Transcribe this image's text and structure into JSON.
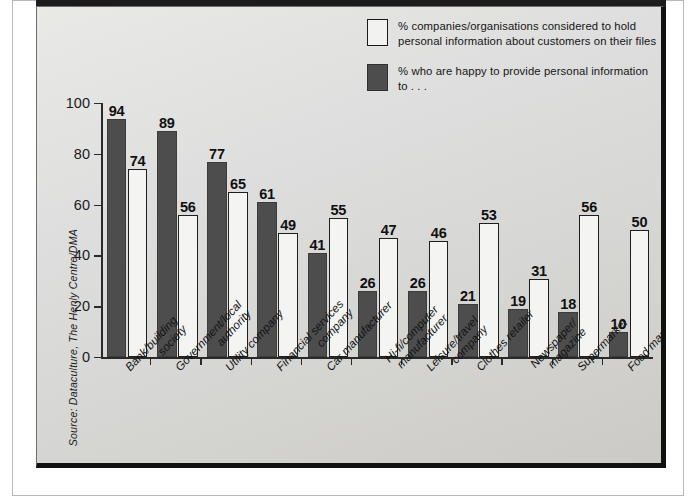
{
  "figure": {
    "source_note": "Source: Dataculture, The Henly Centre/DMA"
  },
  "legend": {
    "items": [
      {
        "swatch": "light",
        "line1": "% companies/organisations considered to hold",
        "line2": "personal information about customers on their files"
      },
      {
        "swatch": "dark",
        "line1": "% who are happy to provide personal information to . . .",
        "line2": ""
      }
    ]
  },
  "chart_data": {
    "type": "bar",
    "title": "",
    "subtitle": "",
    "xlabel": "",
    "ylabel": "",
    "ylim": [
      0,
      100
    ],
    "yticks": [
      0,
      20,
      40,
      60,
      80,
      100
    ],
    "grid": false,
    "legend_position": "top-right",
    "categories": [
      "Bank/building society",
      "Government/local authority",
      "Utility company",
      "Financial services company",
      "Car manufacturer",
      "Hi-fi/computer manufacturer",
      "Leisure/travel company",
      "Clothes retailer",
      "Newspaper/magazine",
      "Supermarket",
      "Food manufacturer"
    ],
    "category_lines": [
      [
        "Bank/building",
        "society"
      ],
      [
        "Government/local",
        "authority"
      ],
      [
        "Utility company",
        ""
      ],
      [
        "Financial services",
        "company"
      ],
      [
        "Car manufacturer",
        ""
      ],
      [
        "Hi-fi/computer",
        "manufacturer"
      ],
      [
        "Leisure/travel",
        "company"
      ],
      [
        "Clothes retailer",
        ""
      ],
      [
        "Newspaper/",
        "magazine"
      ],
      [
        "Supermarket",
        ""
      ],
      [
        "Food manufacturer",
        ""
      ]
    ],
    "series": [
      {
        "name": "% who are happy to provide personal information to . . .",
        "color": "#4d4d4d",
        "values": [
          94,
          89,
          77,
          61,
          41,
          26,
          26,
          21,
          19,
          18,
          10
        ]
      },
      {
        "name": "% companies/organisations considered to hold personal information about customers on their files",
        "color": "#f4f4f2",
        "values": [
          74,
          56,
          65,
          49,
          55,
          47,
          46,
          53,
          31,
          56,
          50
        ]
      }
    ]
  },
  "colors": {
    "dark_bar": "#4d4d4d",
    "light_bar": "#f4f4f2",
    "panel_bg": "#d9d9d6",
    "axis": "#2a2a2a"
  }
}
